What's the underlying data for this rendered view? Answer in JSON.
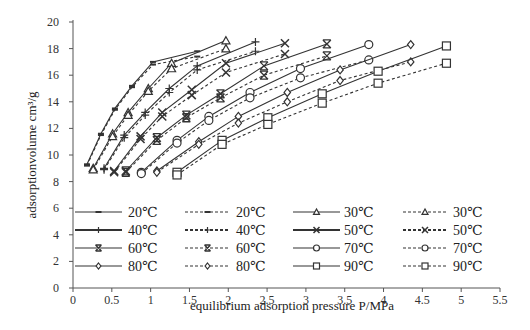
{
  "chart_data": {
    "type": "line",
    "title": "",
    "xlabel": "equilibrium adsorption  pressure P/MPa",
    "ylabel": "adsorptionvolume cm³/g",
    "xlim": [
      0,
      5.5
    ],
    "ylim": [
      0,
      20
    ],
    "xticks": [
      "0",
      "0.5",
      "1",
      "1.5",
      "2",
      "2.5",
      "3",
      "3.5",
      "4",
      "4.5",
      "5",
      "5.5"
    ],
    "yticks": [
      "0",
      "2",
      "4",
      "6",
      "8",
      "10",
      "12",
      "14",
      "16",
      "18",
      "20"
    ],
    "grid": false,
    "legend_position": "inside-lower",
    "series": [
      {
        "name": "20℃",
        "style": "solid",
        "marker": "dash",
        "x": [
          0.18,
          0.36,
          0.54,
          0.76,
          1.03,
          1.6
        ],
        "y": [
          9.3,
          11.6,
          13.5,
          15.2,
          17.0,
          17.8
        ]
      },
      {
        "name": "20℃",
        "style": "dashed",
        "marker": "dash",
        "x": [
          0.18,
          0.36,
          0.54,
          0.76,
          1.03,
          1.6
        ],
        "y": [
          9.2,
          11.5,
          13.4,
          15.1,
          16.8,
          17.4
        ]
      },
      {
        "name": "30℃",
        "style": "solid",
        "marker": "triangle",
        "x": [
          0.26,
          0.51,
          0.71,
          0.97,
          1.27,
          1.97
        ],
        "y": [
          9.0,
          11.6,
          13.2,
          15.0,
          16.9,
          18.6
        ]
      },
      {
        "name": "30℃",
        "style": "dashed",
        "marker": "triangle",
        "x": [
          0.26,
          0.51,
          0.71,
          0.97,
          1.27,
          1.97
        ],
        "y": [
          8.9,
          11.4,
          13.0,
          14.8,
          16.5,
          18.0
        ]
      },
      {
        "name": "40℃",
        "style": "solid",
        "marker": "plus",
        "x": [
          0.4,
          0.66,
          0.93,
          1.24,
          1.6,
          2.35
        ],
        "y": [
          9.0,
          11.5,
          13.2,
          15.0,
          16.7,
          18.5
        ]
      },
      {
        "name": "40℃",
        "style": "dashed",
        "marker": "plus",
        "x": [
          0.4,
          0.66,
          0.93,
          1.24,
          1.6,
          2.35
        ],
        "y": [
          8.9,
          11.3,
          13.0,
          14.7,
          16.4,
          17.8
        ]
      },
      {
        "name": "50℃",
        "style": "solid",
        "marker": "x",
        "x": [
          0.53,
          0.87,
          1.15,
          1.53,
          1.97,
          2.73
        ],
        "y": [
          8.8,
          11.4,
          13.2,
          14.9,
          16.9,
          18.4
        ]
      },
      {
        "name": "50℃",
        "style": "dashed",
        "marker": "x",
        "x": [
          0.53,
          0.87,
          1.15,
          1.53,
          1.97,
          2.73
        ],
        "y": [
          8.7,
          11.2,
          12.9,
          14.5,
          16.2,
          17.6
        ]
      },
      {
        "name": "60℃",
        "style": "solid",
        "marker": "asterisk",
        "x": [
          0.68,
          1.08,
          1.46,
          1.9,
          2.46,
          3.27
        ],
        "y": [
          8.8,
          11.3,
          13.0,
          14.6,
          16.7,
          18.35
        ]
      },
      {
        "name": "60℃",
        "style": "dashed",
        "marker": "asterisk",
        "x": [
          0.68,
          1.08,
          1.46,
          1.9,
          2.46,
          3.27
        ],
        "y": [
          8.7,
          11.1,
          12.8,
          14.3,
          16.0,
          17.45
        ]
      },
      {
        "name": "70℃",
        "style": "solid",
        "marker": "circle",
        "x": [
          0.88,
          1.34,
          1.75,
          2.28,
          2.93,
          3.81
        ],
        "y": [
          8.7,
          11.1,
          12.9,
          14.7,
          16.5,
          18.3
        ]
      },
      {
        "name": "70℃",
        "style": "dashed",
        "marker": "circle",
        "x": [
          0.88,
          1.34,
          1.75,
          2.28,
          2.93,
          3.81
        ],
        "y": [
          8.6,
          10.9,
          12.6,
          14.3,
          15.8,
          17.15
        ]
      },
      {
        "name": "80℃",
        "style": "solid",
        "marker": "diamond",
        "x": [
          1.08,
          1.62,
          2.13,
          2.76,
          3.44,
          4.35
        ],
        "y": [
          8.8,
          11.0,
          12.9,
          14.7,
          16.4,
          18.3
        ]
      },
      {
        "name": "80℃",
        "style": "dashed",
        "marker": "diamond",
        "x": [
          1.08,
          1.62,
          2.13,
          2.76,
          3.44,
          4.35
        ],
        "y": [
          8.7,
          10.8,
          12.4,
          14.0,
          15.6,
          17.0
        ]
      },
      {
        "name": "90℃",
        "style": "solid",
        "marker": "square",
        "x": [
          1.34,
          1.92,
          2.51,
          3.21,
          3.93,
          4.81
        ],
        "y": [
          8.7,
          11.1,
          12.8,
          14.6,
          16.3,
          18.2
        ]
      },
      {
        "name": "90℃",
        "style": "dashed",
        "marker": "square",
        "x": [
          1.34,
          1.92,
          2.51,
          3.21,
          3.93,
          4.81
        ],
        "y": [
          8.5,
          10.8,
          12.3,
          13.9,
          15.4,
          16.9
        ]
      }
    ],
    "legend": [
      {
        "label": "20℃",
        "style": "solid",
        "marker": "dash"
      },
      {
        "label": "20℃",
        "style": "dashed",
        "marker": "dash"
      },
      {
        "label": "30℃",
        "style": "solid",
        "marker": "triangle"
      },
      {
        "label": "30℃",
        "style": "dashed",
        "marker": "triangle"
      },
      {
        "label": "40℃",
        "style": "solid",
        "marker": "plus"
      },
      {
        "label": "40℃",
        "style": "dashed",
        "marker": "plus"
      },
      {
        "label": "50℃",
        "style": "solid",
        "marker": "x"
      },
      {
        "label": "50℃",
        "style": "dashed",
        "marker": "x"
      },
      {
        "label": "60℃",
        "style": "solid",
        "marker": "asterisk"
      },
      {
        "label": "60℃",
        "style": "dashed",
        "marker": "asterisk"
      },
      {
        "label": "70℃",
        "style": "solid",
        "marker": "circle"
      },
      {
        "label": "70℃",
        "style": "dashed",
        "marker": "circle"
      },
      {
        "label": "80℃",
        "style": "solid",
        "marker": "diamond"
      },
      {
        "label": "80℃",
        "style": "dashed",
        "marker": "diamond"
      },
      {
        "label": "90℃",
        "style": "solid",
        "marker": "square"
      },
      {
        "label": "90℃",
        "style": "dashed",
        "marker": "square"
      }
    ]
  },
  "colors": {
    "line": "#333333",
    "axis": "#555555",
    "background": "#ffffff"
  }
}
